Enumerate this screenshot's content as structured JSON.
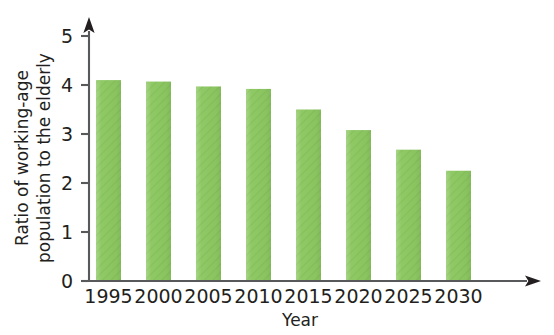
{
  "chart_data": {
    "type": "bar",
    "title": "",
    "subtitle": "",
    "xlabel": "Year",
    "ylabel": "Ratio of working-age population to the elderly",
    "ylabel_line1": "Ratio of working-age",
    "ylabel_line2": "population to the elderly",
    "categories": [
      "1995",
      "2000",
      "2005",
      "2010",
      "2015",
      "2020",
      "2025",
      "2030"
    ],
    "values": [
      4.1,
      4.07,
      3.97,
      3.92,
      3.5,
      3.08,
      2.68,
      2.25
    ],
    "ylim": [
      0,
      5
    ],
    "yticks": [
      "0",
      "1",
      "2",
      "3",
      "4",
      "5"
    ],
    "ytick_values": [
      0,
      1,
      2,
      3,
      4,
      5
    ],
    "grid": false,
    "legend": "none",
    "bar_color": "#8DC863",
    "axis_color": "#58595b",
    "background_color": "#ffffff",
    "axis_style": "arrow-tipped",
    "annotations": []
  }
}
